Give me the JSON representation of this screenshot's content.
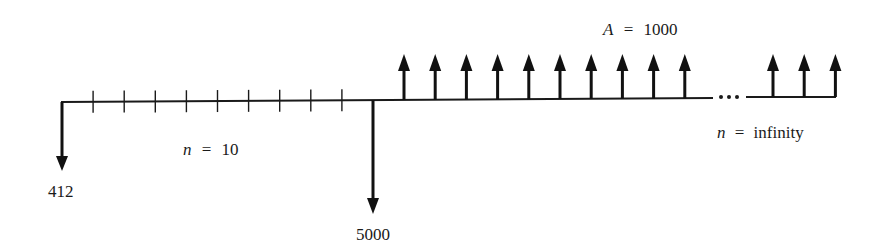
{
  "diagram": {
    "type": "cash-flow-diagram",
    "initial_payment": {
      "value": "412",
      "direction": "down"
    },
    "deposit": {
      "value": "5000",
      "direction": "down",
      "period": 10
    },
    "annuity": {
      "label_var": "A",
      "label_eq": "=",
      "value": "1000",
      "direction": "up",
      "shown_arrows_before_ellipsis": 10,
      "shown_arrows_after_ellipsis": 3
    },
    "first_segment": {
      "label_var": "n",
      "label_eq": "=",
      "value": "10",
      "periods": 10
    },
    "second_segment": {
      "label_var": "n",
      "label_eq": "=",
      "value": "infinity"
    },
    "ellipsis": "..."
  }
}
